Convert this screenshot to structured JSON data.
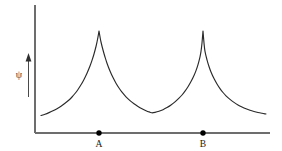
{
  "figure": {
    "title": "",
    "background_color": "#ffffff",
    "width": 282,
    "height": 151
  },
  "axes": {
    "y_axis": {
      "symbol": "ψ",
      "symbol_name": "psi",
      "arrow_direction": "up",
      "line_color": "#6d6d6d",
      "x_pixel": 35,
      "y_top_pixel": 5,
      "y_bottom_pixel": 133
    },
    "x_axis": {
      "label": "",
      "line_color": "#6d6d6d",
      "y_pixel": 133,
      "x_left_pixel": 35,
      "x_right_pixel": 270
    }
  },
  "markers": [
    {
      "label": "A",
      "x": 99,
      "y": 133,
      "dot_color": "#000000"
    },
    {
      "label": "B",
      "x": 203,
      "y": 133,
      "dot_color": "#000000"
    }
  ],
  "chart_data": {
    "type": "line",
    "title": "",
    "xlabel": "",
    "ylabel": "ψ",
    "grid": false,
    "legend": null,
    "curve_color": "#2a2a2a",
    "xlim": [
      35,
      270
    ],
    "ylim_pixels": [
      133,
      31
    ],
    "annotations": [
      {
        "text": "A",
        "x": 99,
        "kind": "nucleus-position"
      },
      {
        "text": "B",
        "x": 203,
        "kind": "nucleus-position"
      }
    ],
    "cusp_centers": [
      99,
      203
    ],
    "peak_value_pixel_y": 31,
    "baseline_value_pixel_y": 133,
    "minimum_between_peaks": {
      "x": 152,
      "y": 113
    },
    "series": [
      {
        "name": "psi",
        "points": [
          [
            41,
            115.5
          ],
          [
            45,
            114.2
          ],
          [
            49,
            112.6
          ],
          [
            53,
            110.8
          ],
          [
            57,
            108.7
          ],
          [
            61,
            106.2
          ],
          [
            65,
            103.3
          ],
          [
            69,
            100.0
          ],
          [
            72,
            97.0
          ],
          [
            75,
            93.5
          ],
          [
            78,
            89.5
          ],
          [
            81,
            84.8
          ],
          [
            84,
            79.4
          ],
          [
            87,
            73.2
          ],
          [
            90,
            66.0
          ],
          [
            92,
            60.4
          ],
          [
            94,
            54.0
          ],
          [
            96,
            46.5
          ],
          [
            97,
            42.0
          ],
          [
            98,
            36.8
          ],
          [
            99,
            31.0
          ],
          [
            100,
            36.8
          ],
          [
            101,
            42.0
          ],
          [
            103,
            50.0
          ],
          [
            105,
            57.0
          ],
          [
            107,
            63.2
          ],
          [
            110,
            71.0
          ],
          [
            113,
            77.6
          ],
          [
            116,
            83.2
          ],
          [
            119,
            88.0
          ],
          [
            122,
            92.2
          ],
          [
            126,
            96.8
          ],
          [
            130,
            100.6
          ],
          [
            134,
            103.8
          ],
          [
            138,
            106.5
          ],
          [
            142,
            108.8
          ],
          [
            146,
            110.7
          ],
          [
            150,
            112.2
          ],
          [
            152,
            112.8
          ],
          [
            155,
            112.4
          ],
          [
            159,
            111.3
          ],
          [
            163,
            109.7
          ],
          [
            167,
            107.6
          ],
          [
            171,
            105.0
          ],
          [
            175,
            101.9
          ],
          [
            179,
            98.2
          ],
          [
            182,
            95.0
          ],
          [
            185,
            91.2
          ],
          [
            188,
            86.8
          ],
          [
            191,
            81.6
          ],
          [
            194,
            75.5
          ],
          [
            196,
            70.6
          ],
          [
            198,
            64.6
          ],
          [
            200,
            56.8
          ],
          [
            201,
            51.4
          ],
          [
            202,
            43.0
          ],
          [
            203,
            31.0
          ],
          [
            204,
            43.0
          ],
          [
            205,
            51.4
          ],
          [
            207,
            59.8
          ],
          [
            209,
            66.5
          ],
          [
            211,
            72.0
          ],
          [
            214,
            78.6
          ],
          [
            217,
            84.0
          ],
          [
            220,
            88.6
          ],
          [
            223,
            92.5
          ],
          [
            226,
            95.8
          ],
          [
            230,
            99.4
          ],
          [
            234,
            102.4
          ],
          [
            238,
            104.9
          ],
          [
            242,
            107.0
          ],
          [
            246,
            108.8
          ],
          [
            250,
            110.3
          ],
          [
            254,
            111.5
          ],
          [
            258,
            112.5
          ],
          [
            262,
            113.3
          ],
          [
            266,
            114.0
          ]
        ]
      }
    ]
  }
}
